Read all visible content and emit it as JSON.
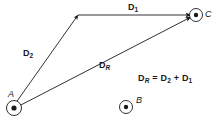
{
  "figure": {
    "type": "vector-addition-diagram",
    "background_color": "#ffffff",
    "stroke_color": "#1a1a1a",
    "points": [
      {
        "id": "A",
        "label": "A",
        "marker": "circle-dot-out-of-page",
        "x": 14,
        "y": 108,
        "outer_r": 7.5,
        "inner_r": 2.6,
        "label_x": 8,
        "label_y": 90
      },
      {
        "id": "B",
        "label": "B",
        "marker": "circle-dot-out-of-page",
        "x": 126,
        "y": 107,
        "outer_r": 6.5,
        "inner_r": 2.2,
        "label_x": 136,
        "label_y": 96
      },
      {
        "id": "C",
        "label": "C",
        "marker": "circle-dot-out-of-page",
        "x": 196,
        "y": 15,
        "outer_r": 6.5,
        "inner_r": 2.2,
        "label_x": 205,
        "label_y": 10
      }
    ],
    "vertex": {
      "id": "V",
      "x": 78,
      "y": 15
    },
    "vectors": [
      {
        "id": "D2",
        "label_text": "D",
        "label_sub": "2",
        "label_sub_italic": false,
        "from": "A",
        "to": "V",
        "x1": 15,
        "y1": 104,
        "x2": 78,
        "y2": 15,
        "label_x": 23,
        "label_y": 49
      },
      {
        "id": "D1",
        "label_text": "D",
        "label_sub": "1",
        "label_sub_italic": false,
        "from": "V",
        "to": "C",
        "x1": 78,
        "y1": 15,
        "x2": 191,
        "y2": 15,
        "label_x": 128,
        "label_y": 3
      },
      {
        "id": "DR",
        "label_text": "D",
        "label_sub": "R",
        "label_sub_italic": true,
        "from": "A",
        "to": "C",
        "x1": 17,
        "y1": 107,
        "x2": 191,
        "y2": 17,
        "label_x": 99,
        "label_y": 61
      }
    ],
    "equation": {
      "text": "D_R = D_2 + D_1",
      "parts": [
        {
          "base": "D",
          "sub": "R",
          "sub_italic": true
        },
        {
          "op": "="
        },
        {
          "base": "D",
          "sub": "2",
          "sub_italic": false
        },
        {
          "op": "+"
        },
        {
          "base": "D",
          "sub": "1",
          "sub_italic": false
        }
      ],
      "x": 138,
      "y": 74
    }
  }
}
